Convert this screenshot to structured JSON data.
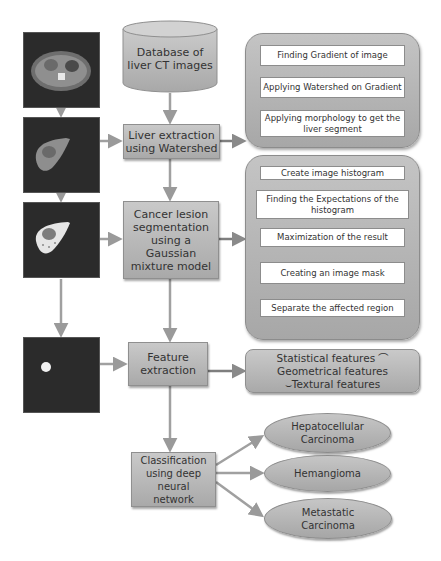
{
  "diagram": {
    "colors": {
      "node_fill": "#b9b9b9",
      "node_border": "#8f8f8f",
      "arrow": "#9a9a9a",
      "ct_background": "#2b2b2b"
    },
    "ct_images": [
      {
        "id": "ct-scan-original",
        "description": "abdominal CT slice"
      },
      {
        "id": "ct-liver-extracted",
        "description": "extracted liver segment"
      },
      {
        "id": "ct-lesion-segmented",
        "description": "liver with segmented lesion"
      },
      {
        "id": "ct-lesion-mask",
        "description": "isolated lesion mask"
      }
    ],
    "main_flow": {
      "database": {
        "label": "Database of liver CT images"
      },
      "liver_extraction": {
        "label": "Liver extraction using Watershed"
      },
      "lesion_segmentation": {
        "label": "Cancer lesion segmentation using a Gaussian mixture model"
      },
      "feature_extraction": {
        "label": "Feature extraction"
      },
      "classification": {
        "label": "Classification using deep neural network"
      }
    },
    "watershed_steps": [
      {
        "label": "Finding Gradient of image"
      },
      {
        "label": "Applying Watershed on Gradient"
      },
      {
        "label": "Applying morphology to get the liver segment"
      }
    ],
    "gmm_steps": [
      {
        "label": "Create image histogram"
      },
      {
        "label": "Finding the Expectations of the histogram"
      },
      {
        "label": "Maximization of the result"
      },
      {
        "label": "Creating an image mask"
      },
      {
        "label": "Separate the affected region"
      }
    ],
    "features": {
      "label": "Statistical features ⌒ Geometrical features ⌣Textural features"
    },
    "classes": [
      {
        "label": "Hepatocellular Carcinoma"
      },
      {
        "label": "Hemangioma"
      },
      {
        "label": "Metastatic Carcinoma"
      }
    ]
  }
}
